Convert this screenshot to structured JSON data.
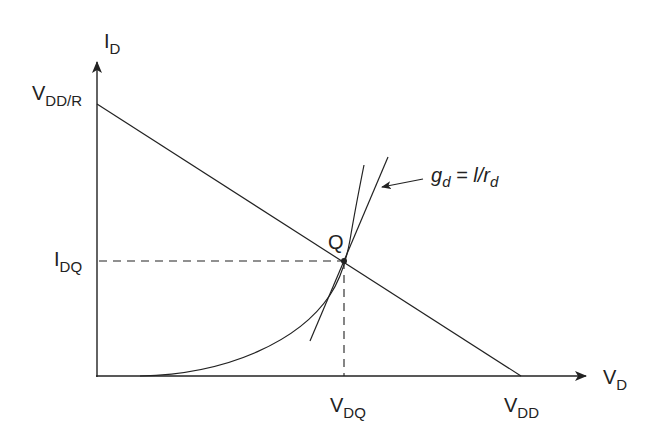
{
  "diagram": {
    "title": "",
    "axes": {
      "y_label": "I",
      "y_label_sub": "D",
      "x_label": "V",
      "x_label_sub": "D"
    },
    "labels": {
      "vdd_r_main": "V",
      "vdd_r_sub": "DD/R",
      "idq_main": "I",
      "idq_sub": "DQ",
      "vdq_main": "V",
      "vdq_sub": "DQ",
      "vdd_main": "V",
      "vdd_sub": "DD",
      "q_point": "Q",
      "gd_main": "g",
      "gd_sub": "d",
      "gd_eq": " = l/r",
      "gd_sub2": "d"
    },
    "colors": {
      "line": "#222222",
      "background": "#ffffff"
    }
  }
}
